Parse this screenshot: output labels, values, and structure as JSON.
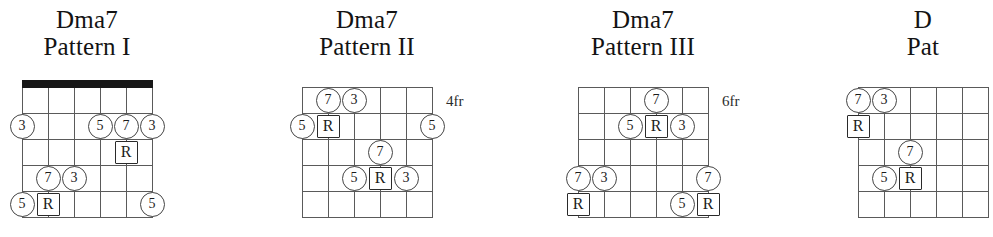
{
  "page": {
    "width": 908,
    "height": 237,
    "background": "#ffffff",
    "line_color": "#5a5a5a",
    "nut_color": "#171717",
    "text_color": "#1a1a1a"
  },
  "diagrams": [
    {
      "id": "pattern-1",
      "chord_name": "Dma7",
      "pattern_label": "Pattern I",
      "fret_label": "",
      "has_nut": true,
      "left": 0,
      "grid_left": 22,
      "grid_top": 90,
      "strings": 6,
      "frets": 5,
      "string_spacing": 26,
      "fret_spacing": 26,
      "truncated": false,
      "markers": [
        {
          "label": "3",
          "shape": "circle",
          "string": 1,
          "fret": 2
        },
        {
          "label": "5",
          "shape": "circle",
          "string": 4,
          "fret": 2
        },
        {
          "label": "7",
          "shape": "circle",
          "string": 5,
          "fret": 2
        },
        {
          "label": "3",
          "shape": "circle",
          "string": 6,
          "fret": 2
        },
        {
          "label": "R",
          "shape": "square",
          "string": 5,
          "fret": 3
        },
        {
          "label": "7",
          "shape": "circle",
          "string": 2,
          "fret": 4
        },
        {
          "label": "3",
          "shape": "circle",
          "string": 3,
          "fret": 4
        },
        {
          "label": "5",
          "shape": "circle",
          "string": 1,
          "fret": 5
        },
        {
          "label": "R",
          "shape": "square",
          "string": 2,
          "fret": 5
        },
        {
          "label": "5",
          "shape": "circle",
          "string": 6,
          "fret": 5
        }
      ]
    },
    {
      "id": "pattern-2",
      "chord_name": "Dma7",
      "pattern_label": "Pattern II",
      "fret_label": "4fr",
      "has_nut": false,
      "left": 280,
      "grid_left": 22,
      "grid_top": 90,
      "strings": 6,
      "frets": 5,
      "string_spacing": 26,
      "fret_spacing": 26,
      "truncated": false,
      "markers": [
        {
          "label": "7",
          "shape": "circle",
          "string": 2,
          "fret": 1
        },
        {
          "label": "3",
          "shape": "circle",
          "string": 3,
          "fret": 1
        },
        {
          "label": "5",
          "shape": "circle",
          "string": 1,
          "fret": 2
        },
        {
          "label": "R",
          "shape": "square",
          "string": 2,
          "fret": 2
        },
        {
          "label": "5",
          "shape": "circle",
          "string": 6,
          "fret": 2
        },
        {
          "label": "7",
          "shape": "circle",
          "string": 4,
          "fret": 3
        },
        {
          "label": "5",
          "shape": "circle",
          "string": 3,
          "fret": 4
        },
        {
          "label": "R",
          "shape": "square",
          "string": 4,
          "fret": 4
        },
        {
          "label": "3",
          "shape": "circle",
          "string": 5,
          "fret": 4
        }
      ]
    },
    {
      "id": "pattern-3",
      "chord_name": "Dma7",
      "pattern_label": "Pattern III",
      "fret_label": "6fr",
      "has_nut": false,
      "left": 556,
      "grid_left": 22,
      "grid_top": 90,
      "strings": 6,
      "frets": 5,
      "string_spacing": 26,
      "fret_spacing": 26,
      "truncated": false,
      "markers": [
        {
          "label": "7",
          "shape": "circle",
          "string": 4,
          "fret": 1
        },
        {
          "label": "5",
          "shape": "circle",
          "string": 3,
          "fret": 2
        },
        {
          "label": "R",
          "shape": "square",
          "string": 4,
          "fret": 2
        },
        {
          "label": "3",
          "shape": "circle",
          "string": 5,
          "fret": 2
        },
        {
          "label": "7",
          "shape": "circle",
          "string": 1,
          "fret": 4
        },
        {
          "label": "3",
          "shape": "circle",
          "string": 2,
          "fret": 4
        },
        {
          "label": "7",
          "shape": "circle",
          "string": 6,
          "fret": 4
        },
        {
          "label": "R",
          "shape": "square",
          "string": 1,
          "fret": 5
        },
        {
          "label": "5",
          "shape": "circle",
          "string": 5,
          "fret": 5
        },
        {
          "label": "R",
          "shape": "square",
          "string": 6,
          "fret": 5
        }
      ]
    },
    {
      "id": "pattern-4",
      "chord_name": "D",
      "pattern_label": "Pat",
      "fret_label": "",
      "has_nut": false,
      "left": 836,
      "grid_left": 22,
      "grid_top": 90,
      "strings": 6,
      "frets": 5,
      "string_spacing": 26,
      "fret_spacing": 26,
      "truncated": true,
      "markers": [
        {
          "label": "7",
          "shape": "circle",
          "string": 1,
          "fret": 1
        },
        {
          "label": "3",
          "shape": "circle",
          "string": 2,
          "fret": 1
        },
        {
          "label": "R",
          "shape": "square",
          "string": 1,
          "fret": 2
        },
        {
          "label": "5",
          "shape": "circle",
          "string": 2,
          "fret": 4
        },
        {
          "label": "7",
          "shape": "circle",
          "string": 3,
          "fret": 3
        },
        {
          "label": "R",
          "shape": "square",
          "string": 3,
          "fret": 4
        }
      ]
    }
  ]
}
